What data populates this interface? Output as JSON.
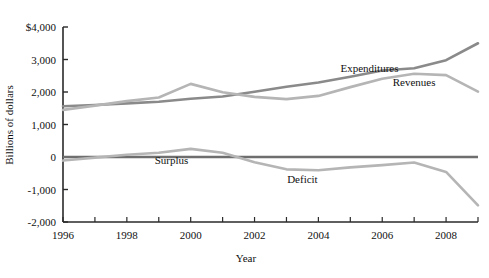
{
  "chart_data": {
    "type": "line",
    "title": "",
    "xlabel": "Year",
    "ylabel": "Billions of dollars",
    "xlim": [
      1996,
      2009
    ],
    "ylim": [
      -2000,
      4000
    ],
    "grid": false,
    "legend_position": "inline-annotations",
    "x": [
      1996,
      1997,
      1998,
      1999,
      2000,
      2001,
      2002,
      2003,
      2004,
      2005,
      2006,
      2007,
      2008,
      2009
    ],
    "x_tick_labels": [
      "1996",
      "1998",
      "2000",
      "2002",
      "2004",
      "2006",
      "2008"
    ],
    "x_tick_values": [
      1996,
      1998,
      2000,
      2002,
      2004,
      2006,
      2008
    ],
    "y_tick_labels": [
      "$4,000",
      "3,000",
      "2,000",
      "1,000",
      "0",
      "-1,000",
      "-2,000"
    ],
    "y_tick_values": [
      4000,
      3000,
      2000,
      1000,
      0,
      -1000,
      -2000
    ],
    "series": [
      {
        "name": "Expenditures",
        "color": "#8a8a8a",
        "label_x": 2006,
        "values": [
          1560,
          1600,
          1650,
          1700,
          1790,
          1860,
          2010,
          2160,
          2290,
          2470,
          2660,
          2730,
          2980,
          3500
        ]
      },
      {
        "name": "Revenues",
        "color": "#b5b5b5",
        "label_x": 2007,
        "values": [
          1450,
          1580,
          1720,
          1830,
          2250,
          1990,
          1850,
          1780,
          1880,
          2150,
          2410,
          2560,
          2520,
          2010
        ]
      },
      {
        "name": "Surplus",
        "color": "#b5b5b5",
        "label_x": 2000,
        "values": [
          -110,
          -20,
          70,
          130,
          250,
          130,
          -160,
          -380,
          -410,
          -320,
          -250,
          -170,
          -460,
          -1490
        ]
      },
      {
        "name": "Deficit",
        "color": "#b5b5b5",
        "label_x": 2004,
        "values": [
          -110,
          -20,
          70,
          130,
          250,
          130,
          -160,
          -380,
          -410,
          -320,
          -250,
          -170,
          -460,
          -1490
        ]
      }
    ],
    "zero_line": 0,
    "zero_line_color": "#6e6e6e",
    "axis_color": "#2a2a2a",
    "annotations": [
      {
        "text": "Expenditures",
        "x": 2005.6,
        "y": 2620
      },
      {
        "text": "Revenues",
        "x": 2007.0,
        "y": 2180
      },
      {
        "text": "Surplus",
        "x": 1999.4,
        "y": -230
      },
      {
        "text": "Deficit",
        "x": 2003.5,
        "y": -790
      }
    ]
  }
}
